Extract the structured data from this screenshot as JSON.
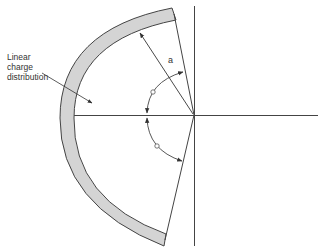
{
  "diagram": {
    "labels": {
      "charge_line1": "Linear",
      "charge_line2": "charge",
      "charge_line3": "distribution",
      "radius": "a"
    },
    "angle_markers": {
      "upper": "angle-symbol-theta",
      "lower": "angle-symbol-theta"
    },
    "colors": {
      "arc_fill": "#d4d4d4",
      "stroke": "#444444",
      "background": "#ffffff"
    }
  }
}
